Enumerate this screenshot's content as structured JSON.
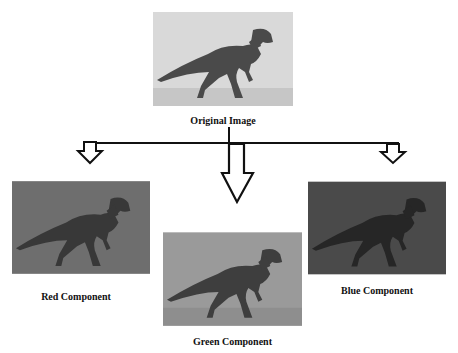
{
  "diagram": {
    "original": {
      "caption": "Original Image",
      "bg": "#d9d9d9",
      "ground": "#c4c4c4",
      "dino": "#4a4a4a"
    },
    "components": [
      {
        "id": "red",
        "caption": "Red Component",
        "bg": "#6e6e6e",
        "ground": "#6a6a6a",
        "dino": "#3a3a3a"
      },
      {
        "id": "green",
        "caption": "Green Component",
        "bg": "#9a9a9a",
        "ground": "#8f8f8f",
        "dino": "#3e3e3e"
      },
      {
        "id": "blue",
        "caption": "Blue Component",
        "bg": "#4a4a4a",
        "ground": "#474747",
        "dino": "#2a2a2a"
      }
    ],
    "connector_color": "#111111"
  }
}
